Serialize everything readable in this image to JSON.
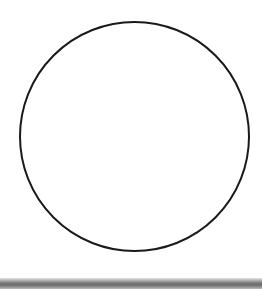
{
  "diagram": {
    "shape": "circle",
    "center_x": 134.5,
    "center_y": 136.5,
    "radius": 114.5,
    "stroke_color": "#1a1a1a",
    "stroke_width": 2,
    "fill": "#ffffff"
  },
  "bottom_bar": {
    "color": "#8e8e8e"
  }
}
